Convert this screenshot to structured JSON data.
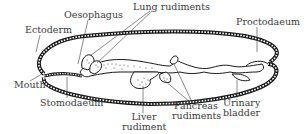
{
  "diagram": {
    "colors": {
      "ink": "#1a1a1a",
      "label": "#3a3a3a",
      "background": "#ffffff"
    },
    "labels": {
      "oesophagus": "Oesophagus",
      "lung_rudiments": "Lung rudiments",
      "ectoderm": "Ectoderm",
      "proctodaeum": "Proctodaeum",
      "mouth": "Mouth",
      "stomodaeum": "Stomodaeum",
      "liver_line1": "Liver",
      "liver_line2": "rudiment",
      "pancreas_line1": "Pancreas",
      "pancreas_line2": "rudiments",
      "bladder_line1": "Urinary",
      "bladder_line2": "bladder"
    }
  }
}
